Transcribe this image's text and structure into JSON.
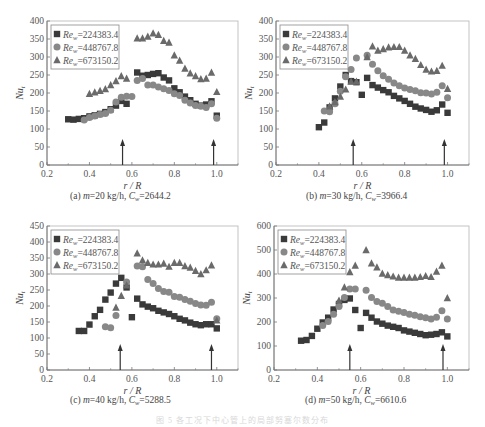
{
  "figure": {
    "caption_faint": "图 5   各工况下中心管上的局部努塞尔数分布"
  },
  "colors": {
    "square": "#3a3a3a",
    "circle": "#888888",
    "triangle": "#6a6a6a",
    "axis": "#777777",
    "arrow": "#333333"
  },
  "chart_data": [
    {
      "id": "a",
      "type": "scatter",
      "caption": "(a) m=20 kg/h, Cw=2644.2",
      "caption_parts": {
        "label": "(a) ",
        "m": "m",
        "m_val": "=20 kg/h, ",
        "c": "C",
        "c_sub": "w",
        "c_val": "=2644.2"
      },
      "xlabel": "r / R",
      "ylabel": "Nu_t",
      "xlim": [
        0.2,
        1.1
      ],
      "ylim": [
        0,
        400
      ],
      "xticks": [
        0.2,
        0.4,
        0.6,
        0.8,
        1.0
      ],
      "xtick_labels": [
        "0.2",
        "0.4",
        "0.6",
        "0.8",
        "1.0"
      ],
      "yticks": [
        0,
        50,
        100,
        150,
        200,
        250,
        300,
        350,
        400
      ],
      "arrows_x": [
        0.556,
        0.985
      ],
      "legend_position": "upper-left",
      "series": [
        {
          "name": "Re_w=224383.4",
          "marker": "square",
          "x": [
            0.3,
            0.325,
            0.35,
            0.375,
            0.4,
            0.425,
            0.45,
            0.475,
            0.5,
            0.525,
            0.55,
            0.575,
            0.625,
            0.65,
            0.675,
            0.7,
            0.725,
            0.75,
            0.775,
            0.8,
            0.825,
            0.85,
            0.875,
            0.9,
            0.925,
            0.95,
            0.975,
            1.0
          ],
          "y": [
            127,
            126,
            128,
            130,
            135,
            138,
            142,
            147,
            155,
            165,
            178,
            170,
            257,
            248,
            250,
            253,
            255,
            243,
            235,
            213,
            202,
            190,
            180,
            170,
            165,
            168,
            177,
            137
          ]
        },
        {
          "name": "Re_w=448767.8",
          "marker": "circle",
          "x": [
            0.375,
            0.4,
            0.425,
            0.45,
            0.475,
            0.5,
            0.525,
            0.55,
            0.575,
            0.6,
            0.625,
            0.65,
            0.675,
            0.7,
            0.725,
            0.75,
            0.775,
            0.8,
            0.825,
            0.85,
            0.875,
            0.9,
            0.925,
            0.95,
            0.975,
            1.0
          ],
          "y": [
            125,
            132,
            136,
            140,
            143,
            152,
            175,
            188,
            191,
            190,
            235,
            240,
            222,
            222,
            217,
            212,
            207,
            198,
            193,
            180,
            172,
            165,
            163,
            160,
            170,
            130
          ]
        },
        {
          "name": "Re_w=673150.2",
          "marker": "triangle",
          "x": [
            0.4,
            0.425,
            0.45,
            0.475,
            0.5,
            0.525,
            0.55,
            0.575,
            0.625,
            0.65,
            0.675,
            0.7,
            0.725,
            0.75,
            0.775,
            0.8,
            0.825,
            0.85,
            0.875,
            0.9,
            0.925,
            0.95,
            0.975,
            1.0
          ],
          "y": [
            198,
            202,
            206,
            211,
            222,
            233,
            247,
            240,
            352,
            352,
            357,
            366,
            362,
            345,
            340,
            305,
            290,
            268,
            255,
            247,
            239,
            240,
            257,
            203
          ]
        }
      ]
    },
    {
      "id": "b",
      "type": "scatter",
      "caption": "(b) m=30 kg/h, Cw=3966.4",
      "caption_parts": {
        "label": "(b) ",
        "m": "m",
        "m_val": "=30 kg/h, ",
        "c": "C",
        "c_sub": "w",
        "c_val": "=3966.4"
      },
      "xlabel": "r / R",
      "ylabel": "Nu_t",
      "xlim": [
        0.2,
        1.1
      ],
      "ylim": [
        0,
        400
      ],
      "xticks": [
        0.2,
        0.4,
        0.6,
        0.8,
        1.0
      ],
      "xtick_labels": [
        "0.2",
        "0.4",
        "0.6",
        "0.8",
        "1.0"
      ],
      "yticks": [
        0,
        50,
        100,
        150,
        200,
        250,
        300,
        350,
        400
      ],
      "arrows_x": [
        0.56,
        0.985
      ],
      "legend_position": "upper-left",
      "series": [
        {
          "name": "Re_w=224383.4",
          "marker": "square",
          "x": [
            0.4,
            0.425,
            0.45,
            0.475,
            0.5,
            0.525,
            0.55,
            0.575,
            0.6,
            0.625,
            0.65,
            0.675,
            0.7,
            0.725,
            0.75,
            0.775,
            0.8,
            0.825,
            0.85,
            0.875,
            0.9,
            0.925,
            0.95,
            0.975,
            1.0
          ],
          "y": [
            105,
            118,
            160,
            185,
            218,
            250,
            233,
            230,
            195,
            242,
            222,
            215,
            208,
            202,
            192,
            185,
            178,
            170,
            162,
            157,
            153,
            148,
            152,
            168,
            145
          ]
        },
        {
          "name": "Re_w=448767.8",
          "marker": "circle",
          "x": [
            0.425,
            0.45,
            0.475,
            0.5,
            0.525,
            0.55,
            0.575,
            0.625,
            0.65,
            0.675,
            0.7,
            0.725,
            0.75,
            0.775,
            0.8,
            0.825,
            0.85,
            0.875,
            0.9,
            0.925,
            0.95,
            0.975,
            1.0
          ],
          "y": [
            150,
            148,
            170,
            205,
            245,
            265,
            297,
            305,
            280,
            262,
            248,
            238,
            228,
            220,
            214,
            210,
            206,
            201,
            200,
            197,
            202,
            220,
            187
          ]
        },
        {
          "name": "Re_w=673150.2",
          "marker": "triangle",
          "x": [
            0.45,
            0.475,
            0.5,
            0.525,
            0.55,
            0.575,
            0.625,
            0.65,
            0.675,
            0.7,
            0.725,
            0.75,
            0.775,
            0.8,
            0.825,
            0.85,
            0.875,
            0.9,
            0.925,
            0.95,
            0.975,
            1.0
          ],
          "y": [
            163,
            175,
            190,
            210,
            232,
            232,
            300,
            330,
            318,
            322,
            327,
            328,
            328,
            318,
            305,
            295,
            278,
            265,
            260,
            262,
            276,
            212
          ]
        }
      ]
    },
    {
      "id": "c",
      "type": "scatter",
      "caption": "(c) m=40 kg/h, Cw=5288.5",
      "caption_parts": {
        "label": "(c) ",
        "m": "m",
        "m_val": "=40 kg/h, ",
        "c": "C",
        "c_sub": "w",
        "c_val": "=5288.5"
      },
      "xlabel": "r / R",
      "ylabel": "Nu_t",
      "xlim": [
        0.2,
        1.1
      ],
      "ylim": [
        0,
        450
      ],
      "xticks": [
        0.2,
        0.4,
        0.6,
        0.8,
        1.0
      ],
      "xtick_labels": [
        "0.2",
        "0.4",
        "0.6",
        "0.8",
        "1.0"
      ],
      "yticks": [
        0,
        50,
        100,
        150,
        200,
        250,
        300,
        350,
        400,
        450
      ],
      "arrows_x": [
        0.545,
        0.975
      ],
      "legend_position": "upper-left",
      "series": [
        {
          "name": "Re_w=224383.4",
          "marker": "square",
          "x": [
            0.35,
            0.375,
            0.4,
            0.425,
            0.45,
            0.475,
            0.5,
            0.525,
            0.55,
            0.575,
            0.6,
            0.625,
            0.65,
            0.675,
            0.7,
            0.725,
            0.75,
            0.775,
            0.8,
            0.825,
            0.85,
            0.875,
            0.9,
            0.925,
            0.95,
            0.975,
            1.0
          ],
          "y": [
            122,
            122,
            142,
            168,
            188,
            220,
            242,
            270,
            288,
            258,
            165,
            223,
            205,
            198,
            193,
            185,
            180,
            175,
            168,
            160,
            155,
            148,
            143,
            140,
            143,
            143,
            130
          ]
        },
        {
          "name": "Re_w=448767.8",
          "marker": "circle",
          "x": [
            0.475,
            0.5,
            0.525,
            0.575,
            0.625,
            0.65,
            0.675,
            0.7,
            0.725,
            0.75,
            0.775,
            0.8,
            0.825,
            0.85,
            0.875,
            0.9,
            0.925,
            0.95,
            0.975,
            1.0
          ],
          "y": [
            135,
            132,
            170,
            275,
            325,
            323,
            283,
            270,
            255,
            245,
            243,
            230,
            227,
            220,
            215,
            208,
            203,
            202,
            212,
            160
          ]
        },
        {
          "name": "Re_w=673150.2",
          "marker": "triangle",
          "x": [
            0.525,
            0.55,
            0.575,
            0.625,
            0.65,
            0.675,
            0.7,
            0.725,
            0.75,
            0.775,
            0.8,
            0.825,
            0.85,
            0.875,
            0.9,
            0.925,
            0.95,
            0.975,
            1.0
          ],
          "y": [
            195,
            232,
            265,
            365,
            343,
            335,
            330,
            330,
            333,
            323,
            335,
            335,
            325,
            320,
            310,
            300,
            312,
            327,
            155
          ]
        }
      ]
    },
    {
      "id": "d",
      "type": "scatter",
      "caption": "(d) m=50 kg/h, Cw=6610.6",
      "caption_parts": {
        "label": "(d) ",
        "m": "m",
        "m_val": "=50 kg/h, ",
        "c": "C",
        "c_sub": "w",
        "c_val": "=6610.6"
      },
      "xlabel": "r / R",
      "ylabel": "Nu_t",
      "xlim": [
        0.2,
        1.1
      ],
      "ylim": [
        0,
        600
      ],
      "xticks": [
        0.2,
        0.4,
        0.6,
        0.8,
        1.0
      ],
      "xtick_labels": [
        "0.2",
        "0.4",
        "0.6",
        "0.8",
        "1.0"
      ],
      "yticks": [
        0,
        100,
        200,
        300,
        400,
        500,
        600
      ],
      "arrows_x": [
        0.55,
        0.98
      ],
      "legend_position": "upper-left",
      "series": [
        {
          "name": "Re_w=224383.4",
          "marker": "square",
          "x": [
            0.325,
            0.35,
            0.375,
            0.4,
            0.425,
            0.45,
            0.475,
            0.5,
            0.525,
            0.55,
            0.575,
            0.6,
            0.625,
            0.65,
            0.675,
            0.7,
            0.725,
            0.75,
            0.775,
            0.8,
            0.825,
            0.85,
            0.875,
            0.9,
            0.925,
            0.95,
            0.975,
            1.0
          ],
          "y": [
            122,
            125,
            142,
            172,
            198,
            218,
            252,
            275,
            292,
            298,
            250,
            175,
            238,
            218,
            202,
            193,
            185,
            180,
            175,
            165,
            160,
            155,
            150,
            145,
            147,
            150,
            157,
            140
          ]
        },
        {
          "name": "Re_w=448767.8",
          "marker": "circle",
          "x": [
            0.425,
            0.45,
            0.475,
            0.5,
            0.525,
            0.55,
            0.575,
            0.625,
            0.65,
            0.675,
            0.7,
            0.725,
            0.75,
            0.775,
            0.8,
            0.825,
            0.85,
            0.875,
            0.9,
            0.925,
            0.95,
            0.975,
            1.0
          ],
          "y": [
            185,
            202,
            232,
            265,
            302,
            338,
            338,
            332,
            302,
            285,
            278,
            265,
            250,
            245,
            240,
            232,
            228,
            222,
            218,
            213,
            220,
            247,
            213
          ]
        },
        {
          "name": "Re_w=673150.2",
          "marker": "triangle",
          "x": [
            0.5,
            0.525,
            0.55,
            0.575,
            0.625,
            0.65,
            0.675,
            0.7,
            0.725,
            0.75,
            0.775,
            0.8,
            0.825,
            0.85,
            0.875,
            0.9,
            0.925,
            0.95,
            0.975,
            1.0
          ],
          "y": [
            290,
            345,
            408,
            435,
            500,
            445,
            428,
            402,
            396,
            390,
            385,
            385,
            385,
            385,
            388,
            392,
            388,
            410,
            435,
            300
          ]
        }
      ]
    }
  ],
  "panels_layout": [
    {
      "left": 0,
      "top": 0,
      "plot": {
        "x0": 47,
        "x1": 238,
        "y0": 21,
        "y1": 165
      },
      "caption_top": 191,
      "caption_left": 70
    },
    {
      "left": 0,
      "top": 0,
      "plot": {
        "x0": 276,
        "x1": 469,
        "y0": 21,
        "y1": 165
      },
      "caption_top": 191,
      "caption_left": 306
    },
    {
      "left": 0,
      "top": 0,
      "plot": {
        "x0": 47,
        "x1": 238,
        "y0": 226,
        "y1": 370
      },
      "caption_top": 395,
      "caption_left": 70
    },
    {
      "left": 0,
      "top": 0,
      "plot": {
        "x0": 274,
        "x1": 469,
        "y0": 226,
        "y1": 370
      },
      "caption_top": 395,
      "caption_left": 305
    }
  ]
}
